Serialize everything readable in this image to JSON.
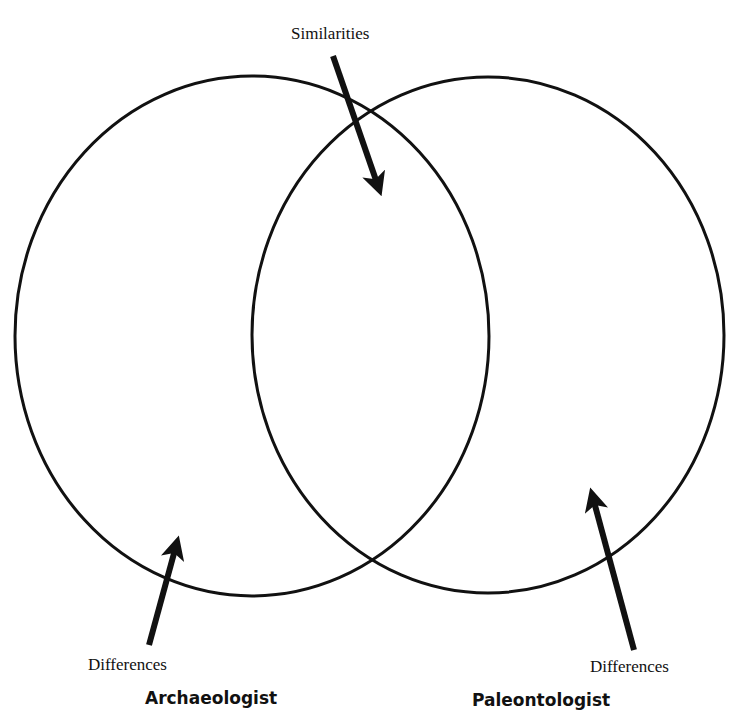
{
  "diagram": {
    "type": "venn",
    "labels": {
      "similarities": "Similarities",
      "left_differences": "Differences",
      "right_differences": "Differences"
    },
    "sets": [
      {
        "name": "Archaeologist"
      },
      {
        "name": "Paleontologist"
      }
    ],
    "colors": {
      "stroke": "#111111",
      "background": "#ffffff"
    }
  }
}
